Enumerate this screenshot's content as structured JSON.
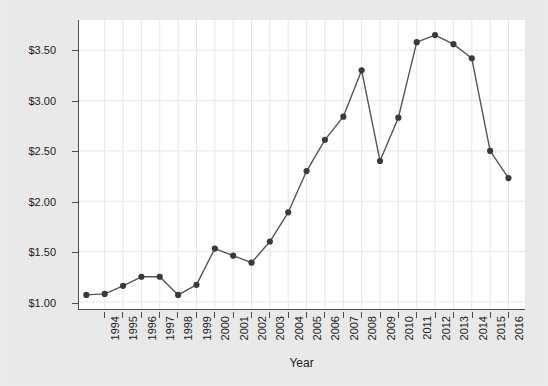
{
  "chart_data": {
    "type": "line",
    "title": "",
    "xlabel": "Year",
    "ylabel": "Price of Gasoline ($ per gallon)",
    "x": [
      1993,
      1994,
      1995,
      1996,
      1997,
      1998,
      1999,
      2000,
      2001,
      2002,
      2003,
      2004,
      2005,
      2006,
      2007,
      2008,
      2009,
      2010,
      2011,
      2012,
      2013,
      2014,
      2015,
      2016
    ],
    "values": [
      1.07,
      1.08,
      1.16,
      1.25,
      1.25,
      1.07,
      1.17,
      1.53,
      1.46,
      1.39,
      1.6,
      1.89,
      2.3,
      2.61,
      2.84,
      3.3,
      2.4,
      2.83,
      3.58,
      3.65,
      3.56,
      3.42,
      2.5,
      2.23
    ],
    "xtick_labels": [
      "1994",
      "1995",
      "1996",
      "1997",
      "1998",
      "1999",
      "2000",
      "2001",
      "2002",
      "2003",
      "2004",
      "2005",
      "2006",
      "2007",
      "2008",
      "2009",
      "2010",
      "2011",
      "2012",
      "2013",
      "2014",
      "2015",
      "2016"
    ],
    "xtick_values": [
      1994,
      1995,
      1996,
      1997,
      1998,
      1999,
      2000,
      2001,
      2002,
      2003,
      2004,
      2005,
      2006,
      2007,
      2008,
      2009,
      2010,
      2011,
      2012,
      2013,
      2014,
      2015,
      2016
    ],
    "ytick_labels": [
      "$1.00",
      "$1.50",
      "$2.00",
      "$2.50",
      "$3.00",
      "$3.50"
    ],
    "ytick_values": [
      1.0,
      1.5,
      2.0,
      2.5,
      3.0,
      3.5
    ],
    "xlim": [
      1992.6,
      2016.9
    ],
    "ylim": [
      0.93,
      3.8
    ],
    "grid": true,
    "legend": null,
    "line_color": "#555555",
    "marker_color": "#3a3a3a",
    "marker": "circle",
    "plot_background": "#ffffff",
    "figure_background": "#e9e9e9",
    "grid_color": "#e6e6ec",
    "axis_color": "#4d4d4d"
  }
}
